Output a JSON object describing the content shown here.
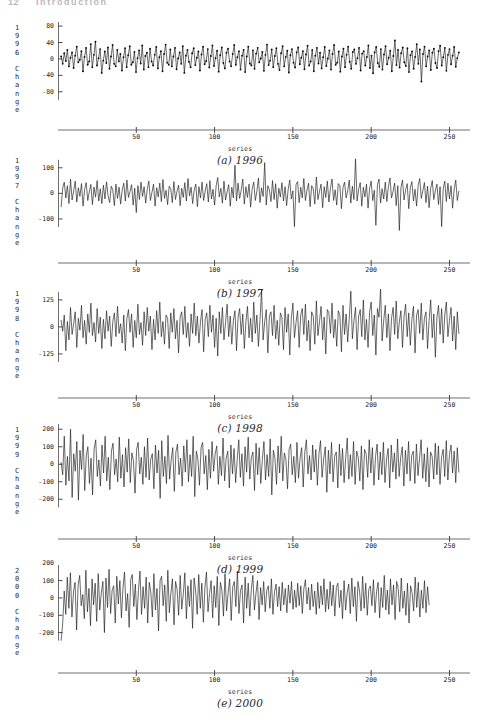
{
  "page": {
    "number": "12",
    "running_title": "Introduction",
    "header_color": "#b9b9bd"
  },
  "shared": {
    "xlabel": "series",
    "xticks": [
      50,
      100,
      150,
      200,
      250
    ],
    "xlim": [
      0,
      258
    ],
    "ink_color": "#1b1b1b",
    "axis_color": "#6f6f6f"
  },
  "chart_data": [
    {
      "type": "line",
      "id": "chart-1996",
      "caption": "(a) 1996",
      "ylabel": "1996 Change",
      "xlabel": "series",
      "yticks": [
        80,
        40,
        0,
        -40,
        -80
      ],
      "ylim": [
        -100,
        90
      ],
      "xlim": [
        0,
        258
      ],
      "xticks": [
        50,
        100,
        150,
        200,
        250
      ],
      "markers": true,
      "grid": false,
      "n_points": 256,
      "values": [
        6,
        -12,
        14,
        -5,
        22,
        -18,
        3,
        16,
        -22,
        8,
        30,
        -8,
        -2,
        19,
        -30,
        5,
        27,
        -14,
        -6,
        36,
        -20,
        10,
        42,
        -16,
        2,
        24,
        -34,
        -4,
        18,
        -10,
        28,
        -24,
        6,
        34,
        -12,
        -18,
        22,
        -6,
        12,
        -28,
        4,
        26,
        -20,
        9,
        31,
        -14,
        -8,
        17,
        -32,
        2,
        21,
        -11,
        33,
        -26,
        7,
        15,
        -20,
        25,
        -6,
        -16,
        10,
        29,
        -23,
        4,
        19,
        -30,
        12,
        35,
        -9,
        -14,
        23,
        -18,
        6,
        27,
        -25,
        1,
        16,
        -12,
        31,
        -34,
        8,
        22,
        -7,
        -20,
        14,
        26,
        -15,
        3,
        18,
        -28,
        11,
        30,
        -13,
        -5,
        24,
        -21,
        7,
        33,
        -17,
        2,
        20,
        -31,
        9,
        28,
        -10,
        -23,
        15,
        25,
        -6,
        -18,
        12,
        34,
        -14,
        4,
        19,
        -26,
        8,
        22,
        -32,
        6,
        30,
        -11,
        -16,
        21,
        -24,
        13,
        27,
        -8,
        1,
        17,
        -29,
        10,
        35,
        -15,
        -4,
        23,
        -20,
        7,
        26,
        -12,
        -27,
        14,
        31,
        -18,
        5,
        20,
        -33,
        9,
        24,
        -9,
        -21,
        16,
        28,
        -13,
        3,
        19,
        -25,
        11,
        32,
        -16,
        -6,
        22,
        -30,
        8,
        27,
        -11,
        15,
        -23,
        4,
        29,
        -17,
        1,
        21,
        -26,
        12,
        34,
        -14,
        -9,
        18,
        -31,
        6,
        25,
        -20,
        10,
        30,
        -7,
        -24,
        17,
        23,
        -12,
        2,
        27,
        -28,
        13,
        19,
        -16,
        5,
        33,
        -22,
        8,
        -35,
        16,
        29,
        -10,
        -19,
        24,
        -26,
        11,
        31,
        -13,
        3,
        20,
        -30,
        7,
        45,
        -15,
        22,
        -21,
        14,
        28,
        -8,
        -17,
        26,
        -32,
        9,
        18,
        -24,
        5,
        36,
        -12,
        23,
        -55,
        12,
        30,
        -18,
        6,
        21,
        -27,
        15,
        25,
        -10,
        -22,
        19,
        32,
        -16,
        4,
        27,
        -29,
        10,
        24,
        -13,
        8,
        29,
        -19,
        2,
        16
      ],
      "ytitle_chars": [
        "1",
        "9",
        "9",
        "6",
        " ",
        "C",
        "h",
        "a",
        "n",
        "g",
        "e"
      ]
    },
    {
      "type": "line",
      "id": "chart-1997",
      "caption": "(b) 1997",
      "ylabel": "1997 Change",
      "xlabel": "series",
      "yticks": [
        100,
        0,
        -100
      ],
      "ylim": [
        -155,
        150
      ],
      "xlim": [
        0,
        258
      ],
      "xticks": [
        50,
        100,
        150,
        200,
        250
      ],
      "markers": false,
      "grid": false,
      "n_points": 256,
      "values": [
        -52,
        20,
        44,
        -18,
        30,
        -40,
        55,
        -26,
        10,
        48,
        -34,
        22,
        -12,
        38,
        -50,
        15,
        42,
        -28,
        6,
        35,
        -44,
        25,
        -15,
        50,
        -30,
        18,
        -40,
        32,
        -22,
        45,
        -10,
        -36,
        28,
        14,
        -48,
        36,
        -20,
        24,
        -42,
        12,
        40,
        -30,
        52,
        -16,
        8,
        34,
        -46,
        20,
        -75,
        30,
        -24,
        44,
        -12,
        26,
        -38,
        16,
        48,
        -28,
        4,
        36,
        -50,
        22,
        -14,
        40,
        -32,
        54,
        -20,
        12,
        -44,
        28,
        18,
        -36,
        46,
        -24,
        8,
        32,
        -48,
        20,
        -16,
        42,
        -30,
        58,
        -10,
        24,
        -40,
        14,
        36,
        -52,
        26,
        -18,
        44,
        -28,
        10,
        38,
        -34,
        50,
        -22,
        16,
        -46,
        30,
        62,
        -14,
        20,
        -38,
        48,
        -26,
        6,
        34,
        -50,
        24,
        -18,
        110,
        -30,
        40,
        -20,
        12,
        56,
        -42,
        26,
        -16,
        36,
        -54,
        18,
        44,
        -28,
        8,
        60,
        -36,
        22,
        -12,
        120,
        -46,
        30,
        14,
        -32,
        50,
        -24,
        38,
        -58,
        20,
        -14,
        42,
        -30,
        26,
        -48,
        16,
        52,
        -22,
        10,
        -130,
        34,
        46,
        -36,
        24,
        -18,
        58,
        -28,
        12,
        40,
        -52,
        30,
        18,
        -42,
        64,
        -24,
        8,
        36,
        -56,
        26,
        -16,
        48,
        -34,
        20,
        56,
        -28,
        14,
        -46,
        38,
        30,
        -60,
        22,
        44,
        -18,
        10,
        52,
        -38,
        28,
        -24,
        135,
        -30,
        16,
        42,
        -50,
        24,
        -14,
        36,
        -58,
        20,
        48,
        -28,
        12,
        -125,
        34,
        56,
        -38,
        18,
        -22,
        44,
        -32,
        26,
        60,
        -18,
        8,
        40,
        -48,
        30,
        -145,
        22,
        52,
        -26,
        14,
        38,
        -60,
        24,
        46,
        -30,
        16,
        -50,
        32,
        58,
        -20,
        10,
        42,
        -36,
        28,
        -56,
        20,
        50,
        -24,
        12,
        36,
        -44,
        26,
        -130,
        18,
        48,
        -32,
        40,
        -22,
        30,
        -58,
        16,
        52,
        -28,
        8
      ],
      "ytitle_chars": [
        "1",
        "9",
        "9",
        "7",
        " ",
        "C",
        "h",
        "a",
        "n",
        "g",
        "e"
      ]
    },
    {
      "type": "line",
      "id": "chart-1998",
      "caption": "(c) 1998",
      "ylabel": "1998 Change",
      "xlabel": "series",
      "yticks": [
        125,
        0,
        -125
      ],
      "ylim": [
        -190,
        180
      ],
      "xlim": [
        0,
        258
      ],
      "xticks": [
        50,
        100,
        150,
        200,
        250
      ],
      "markers": false,
      "grid": false,
      "n_points": 256,
      "values": [
        30,
        -20,
        55,
        -110,
        25,
        -60,
        90,
        -35,
        15,
        70,
        -95,
        40,
        -15,
        100,
        -50,
        30,
        -80,
        60,
        -25,
        110,
        -40,
        20,
        -70,
        85,
        -30,
        45,
        -100,
        35,
        -55,
        75,
        -20,
        50,
        -90,
        25,
        65,
        -45,
        95,
        -30,
        15,
        -75,
        55,
        -110,
        40,
        80,
        -25,
        60,
        -95,
        30,
        -50,
        105,
        -35,
        20,
        -85,
        70,
        -40,
        90,
        -20,
        50,
        -105,
        35,
        -60,
        75,
        -30,
        115,
        -45,
        25,
        -80,
        55,
        40,
        -100,
        65,
        -25,
        85,
        -55,
        30,
        -120,
        45,
        70,
        -35,
        95,
        -50,
        20,
        -90,
        60,
        -30,
        110,
        -40,
        50,
        -75,
        25,
        80,
        -115,
        35,
        65,
        -45,
        100,
        -25,
        55,
        -95,
        40,
        -135,
        70,
        -30,
        90,
        -60,
        20,
        105,
        -45,
        50,
        -80,
        30,
        75,
        -110,
        45,
        85,
        -35,
        60,
        -100,
        25,
        95,
        -50,
        40,
        -70,
        115,
        -30,
        55,
        -90,
        35,
        170,
        -60,
        25,
        80,
        -120,
        50,
        70,
        -40,
        100,
        -55,
        30,
        -85,
        65,
        45,
        -105,
        90,
        -25,
        60,
        -130,
        40,
        110,
        -50,
        20,
        75,
        -95,
        55,
        85,
        -35,
        105,
        -65,
        30,
        -110,
        70,
        50,
        -80,
        120,
        -40,
        25,
        95,
        -60,
        45,
        -125,
        80,
        65,
        -30,
        110,
        -50,
        35,
        -90,
        75,
        55,
        -115,
        100,
        -35,
        60,
        -70,
        40,
        165,
        -55,
        30,
        90,
        -105,
        50,
        80,
        -45,
        125,
        -60,
        35,
        -95,
        70,
        115,
        -40,
        55,
        -130,
        85,
        45,
        175,
        -65,
        30,
        100,
        -50,
        60,
        -110,
        40,
        90,
        -35,
        120,
        -55,
        25,
        75,
        -95,
        50,
        105,
        -45,
        65,
        -85,
        35,
        95,
        -120,
        55,
        80,
        -30,
        110,
        -60,
        40,
        70,
        -100,
        30,
        125,
        -50,
        60,
        -140,
        45,
        100,
        -35,
        85,
        -75,
        55,
        115,
        -45,
        30,
        90,
        -65,
        50,
        -105,
        70,
        -30
      ],
      "ytitle_chars": [
        "1",
        "9",
        "9",
        "8",
        " ",
        "C",
        "h",
        "a",
        "n",
        "g",
        "e"
      ]
    },
    {
      "type": "line",
      "id": "chart-1999",
      "caption": "(d) 1999",
      "ylabel": "1999 Change",
      "xlabel": "series",
      "yticks": [
        200,
        100,
        0,
        -100,
        -200
      ],
      "ylim": [
        -250,
        230
      ],
      "xlim": [
        0,
        258
      ],
      "xticks": [
        50,
        100,
        150,
        200,
        250
      ],
      "markers": false,
      "grid": false,
      "n_points": 256,
      "values": [
        10,
        -60,
        160,
        -120,
        45,
        -95,
        200,
        -190,
        60,
        -40,
        130,
        -205,
        80,
        -30,
        170,
        -150,
        50,
        100,
        -110,
        35,
        -175,
        90,
        140,
        -70,
        25,
        -125,
        110,
        -50,
        160,
        -95,
        40,
        -145,
        75,
        120,
        -60,
        30,
        -100,
        155,
        -80,
        55,
        -130,
        95,
        -45,
        145,
        -105,
        65,
        20,
        -165,
        85,
        125,
        -55,
        40,
        -115,
        100,
        -75,
        150,
        -90,
        30,
        60,
        -140,
        110,
        -50,
        80,
        -195,
        135,
        -70,
        45,
        -110,
        165,
        -85,
        25,
        95,
        -155,
        70,
        115,
        -60,
        35,
        -125,
        105,
        -45,
        140,
        -100,
        55,
        -70,
        160,
        -185,
        75,
        30,
        -120,
        95,
        125,
        -55,
        50,
        -145,
        85,
        -80,
        130,
        -40,
        60,
        105,
        -115,
        45,
        -65,
        150,
        -95,
        35,
        75,
        -135,
        110,
        -55,
        90,
        -105,
        25,
        140,
        -75,
        60,
        -125,
        100,
        -45,
        155,
        -85,
        40,
        70,
        -150,
        120,
        -60,
        95,
        -110,
        30,
        130,
        -90,
        55,
        -70,
        145,
        -175,
        80,
        35,
        -115,
        105,
        -50,
        160,
        -95,
        65,
        25,
        -140,
        85,
        115,
        -60,
        45,
        -105,
        125,
        -80,
        35,
        95,
        -130,
        70,
        140,
        -55,
        50,
        -90,
        110,
        -45,
        85,
        -120,
        60,
        135,
        -75,
        30,
        100,
        -160,
        80,
        -55,
        125,
        -100,
        45,
        70,
        -135,
        115,
        -65,
        90,
        -105,
        35,
        150,
        -85,
        55,
        -70,
        130,
        -115,
        75,
        40,
        -95,
        105,
        -145,
        85,
        60,
        -75,
        140,
        -50,
        95,
        -120,
        45,
        115,
        -90,
        70,
        -60,
        125,
        -105,
        30,
        90,
        -135,
        110,
        -45,
        65,
        -85,
        145,
        -70,
        40,
        100,
        -125,
        80,
        -55,
        130,
        -95,
        50,
        75,
        -110,
        115,
        -65,
        35,
        140,
        -80,
        60,
        -100,
        95,
        -130,
        70,
        45,
        -85,
        120,
        -60,
        105,
        -115,
        40,
        85,
        -70,
        135,
        -90,
        55,
        110,
        -50,
        75,
        -105,
        95,
        -45
      ],
      "ytitle_chars": [
        "1",
        "9",
        "9",
        "9",
        " ",
        "C",
        "h",
        "a",
        "n",
        "g",
        "e"
      ]
    },
    {
      "type": "line",
      "id": "chart-2000",
      "caption": "(e) 2000",
      "ylabel": "2000 Change",
      "xlabel": "series",
      "yticks": [
        200,
        100,
        0,
        -100,
        -200
      ],
      "ylim": [
        -260,
        190
      ],
      "xlim": [
        0,
        258
      ],
      "xticks": [
        50,
        100,
        150,
        200,
        250
      ],
      "markers": false,
      "grid": false,
      "data_end_x": 235,
      "n_points": 232,
      "values": [
        -245,
        -150,
        40,
        -95,
        120,
        -60,
        145,
        -110,
        35,
        90,
        -185,
        75,
        130,
        -45,
        20,
        -120,
        160,
        -80,
        55,
        -160,
        110,
        -40,
        85,
        -135,
        140,
        -70,
        30,
        95,
        -200,
        115,
        -55,
        165,
        -90,
        45,
        70,
        -145,
        125,
        -35,
        100,
        -115,
        60,
        150,
        -75,
        25,
        -170,
        105,
        135,
        -50,
        80,
        -125,
        45,
        155,
        -95,
        65,
        -60,
        120,
        -145,
        90,
        35,
        -110,
        140,
        -70,
        55,
        -190,
        100,
        125,
        -45,
        75,
        -135,
        160,
        -85,
        30,
        110,
        -155,
        95,
        50,
        -100,
        130,
        -65,
        20,
        145,
        -120,
        70,
        -50,
        105,
        -175,
        115,
        40,
        -95,
        135,
        -60,
        85,
        -140,
        60,
        150,
        -80,
        25,
        100,
        -115,
        70,
        -55,
        125,
        -160,
        90,
        45,
        -105,
        140,
        -75,
        30,
        110,
        -130,
        65,
        95,
        -50,
        155,
        -90,
        40,
        75,
        -145,
        120,
        -60,
        85,
        -105,
        50,
        130,
        -70,
        25,
        100,
        -125,
        60,
        -40,
        95,
        -80,
        45,
        70,
        -60,
        110,
        -95,
        35,
        80,
        -50,
        65,
        -75,
        90,
        -40,
        55,
        -85,
        75,
        -30,
        95,
        -65,
        45,
        -55,
        85,
        -45,
        70,
        -90,
        55,
        105,
        -35,
        60,
        -70,
        80,
        -50,
        40,
        -95,
        90,
        -60,
        70,
        -40,
        110,
        -80,
        50,
        -65,
        95,
        -45,
        75,
        -105,
        60,
        85,
        -55,
        45,
        -120,
        100,
        -70,
        30,
        80,
        -90,
        115,
        -50,
        65,
        -135,
        95,
        40,
        -75,
        125,
        -60,
        85,
        -100,
        50,
        70,
        -45,
        105,
        -85,
        35,
        90,
        -115,
        60,
        -55,
        130,
        -70,
        45,
        -95,
        110,
        -40,
        75,
        -125,
        95,
        55,
        -80,
        115,
        -60,
        40,
        -100,
        85,
        -145,
        70,
        30,
        -75,
        120,
        -55,
        90,
        -110,
        45,
        -60,
        100,
        -85,
        65,
        -40
      ],
      "ytitle_chars": [
        "2",
        "0",
        "0",
        "0",
        " ",
        "C",
        "h",
        "a",
        "n",
        "g",
        "e"
      ]
    }
  ]
}
